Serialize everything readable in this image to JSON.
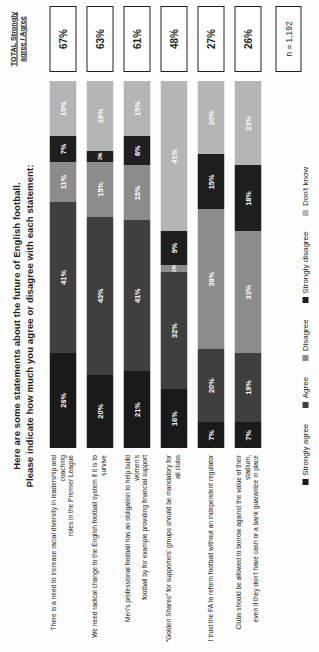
{
  "title": {
    "line1": "Here are some statements about the future of English football.",
    "line2": "Please indicate how much you agree or disagree with each statement:"
  },
  "total_column": {
    "header_line1": "TOTAL Strongly",
    "header_line2": "agree / Agree"
  },
  "sample": {
    "n_label": "n = 1,192"
  },
  "legend": {
    "items": [
      {
        "label": "Strongly agree",
        "color": "#1a1a1a"
      },
      {
        "label": "Agree",
        "color": "#3f3f3f"
      },
      {
        "label": "Disagree",
        "color": "#8c8c8c"
      },
      {
        "label": "Strongly disagree",
        "color": "#1f1f1f"
      },
      {
        "label": "Don't know",
        "color": "#b5b5b5"
      }
    ]
  },
  "chart_data": {
    "type": "bar",
    "title": "Here are some statements about the future of English football. Please indicate how much you agree or disagree with each statement:",
    "xlabel": "",
    "ylabel": "",
    "orientation": "horizontal",
    "stacked": true,
    "units": "%",
    "xlim": [
      0,
      100
    ],
    "grid": false,
    "legend_position": "bottom",
    "categories": [
      "There is a need to increase racial diversity in leadership and coaching roles in the Premier League",
      "We need radical change to the English football system if it is to survive",
      "Men's professional football has an obligation to help build women's football by for example providing financial support",
      "“Golden Shares” for supporters’ groups should be mandatory for all clubs",
      "I trust the FA to reform football without an independent regulator",
      "Clubs should be allowed to borrow against the value of their stadium, even if they don’t have cash or a bank guarantee in place"
    ],
    "category_labels": [
      {
        "line1": "There is a need to increase racial diversity in leadership and coaching",
        "line2": "roles in the Premier League"
      },
      {
        "line1": "We need radical change to the English football system if it is to survive",
        "line2": ""
      },
      {
        "line1": "Men's professional football has an obligation to help build women's",
        "line2": "football by for example providing financial support"
      },
      {
        "line1": "“Golden Shares” for supporters’ groups should be mandatory for all clubs",
        "line2": ""
      },
      {
        "line1": "I trust the FA to reform football without an independent regulator",
        "line2": ""
      },
      {
        "line1": "Clubs should be allowed to borrow against the value of their stadium,",
        "line2": "even if they don’t have cash or a bank guarantee in place"
      }
    ],
    "series": [
      {
        "name": "Strongly agree",
        "color": "#1a1a1a",
        "values": [
          26,
          20,
          21,
          16,
          7,
          7
        ]
      },
      {
        "name": "Agree",
        "color": "#3f3f3f",
        "values": [
          41,
          43,
          41,
          32,
          20,
          19
        ]
      },
      {
        "name": "Disagree",
        "color": "#8c8c8c",
        "values": [
          11,
          15,
          15,
          2,
          38,
          33
        ]
      },
      {
        "name": "Strongly disagree",
        "color": "#1f1f1f",
        "values": [
          7,
          3,
          8,
          9,
          15,
          18
        ]
      },
      {
        "name": "Don't know",
        "color": "#b5b5b5",
        "values": [
          15,
          19,
          15,
          41,
          20,
          23
        ]
      }
    ],
    "totals": [
      "67%",
      "63%",
      "61%",
      "48%",
      "27%",
      "26%"
    ],
    "labels": [
      [
        "26%",
        "41%",
        "11%",
        "7%",
        "15%"
      ],
      [
        "20%",
        "43%",
        "15%",
        "3%",
        "19%"
      ],
      [
        "21%",
        "41%",
        "15%",
        "8%",
        "15%"
      ],
      [
        "16%",
        "32%",
        "2%",
        "9%",
        "41%"
      ],
      [
        "7%",
        "20%",
        "38%",
        "15%",
        "20%"
      ],
      [
        "7%",
        "19%",
        "33%",
        "18%",
        "23%"
      ]
    ],
    "n": "n = 1,192"
  }
}
